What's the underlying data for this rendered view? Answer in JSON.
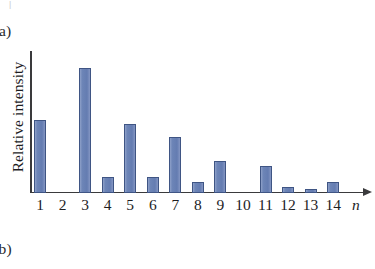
{
  "figure": {
    "top_artifact": "|",
    "caption_a": "(a)",
    "caption_b": "(b)",
    "axis_variable": "n",
    "y_axis_label": "Relative intensity"
  },
  "chart_data": {
    "type": "bar",
    "title": "",
    "subtitle": "",
    "xlabel": "n",
    "ylabel": "Relative intensity",
    "categories": [
      "1",
      "2",
      "3",
      "4",
      "5",
      "6",
      "7",
      "8",
      "9",
      "10",
      "11",
      "12",
      "13",
      "14"
    ],
    "values": [
      0.59,
      0.0,
      1.0,
      0.13,
      0.55,
      0.13,
      0.45,
      0.09,
      0.26,
      0.0,
      0.22,
      0.05,
      0.035,
      0.085
    ],
    "value_units": "relative (peak = 1.0)",
    "ylim": [
      0,
      1.18
    ],
    "grid": false,
    "legend": null,
    "axis_style": "open axes with arrow on x-axis, no tick marks, no y tick labels",
    "bar_color": "#6f86b8",
    "bar_border_color": "#3f5584",
    "axis_color": "#3a3a3c",
    "annotations": [
      "(a)",
      "(b)"
    ]
  }
}
